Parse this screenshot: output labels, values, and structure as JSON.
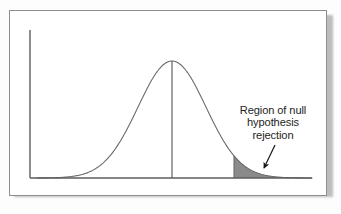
{
  "figure": {
    "name": "normal-distribution-rejection-region",
    "background_color": "#fdfdfd",
    "plate_color": "#ffffff",
    "frame_color": "#8e8e8e"
  },
  "annotation": {
    "name": "rejection-region-label",
    "line1": "Region of null",
    "line2": "hypothesis",
    "line3": "rejection",
    "text_color": "#1d1d1d",
    "pointer": "arrow-icon"
  },
  "chart_data": {
    "type": "area",
    "title": "",
    "subtitle": "",
    "xlabel": "",
    "ylabel": "",
    "grid": false,
    "legend": null,
    "axes": {
      "y_axis_visible": true,
      "x_axis_visible": true,
      "y_axis_x_px": 30,
      "baseline_y_px": 178,
      "y_axis_top_px": 30,
      "x_axis_right_px": 312,
      "tick_labels_x": [],
      "tick_labels_y": []
    },
    "curve": {
      "name": "normal-density-curve",
      "distribution": "normal",
      "mean_x_px": 172,
      "peak_y_px": 61,
      "sigma_px": 34,
      "stroke_color": "#6a6a6a",
      "stroke_width": 1.1,
      "x_start_px": 37,
      "x_end_px": 312
    },
    "center_line": {
      "name": "mean-vertical-line",
      "x_px": 172,
      "y_top_px": 61,
      "y_bottom_px": 178,
      "stroke_color": "#545454"
    },
    "shaded_region": {
      "name": "rejection-region-shading",
      "label": "Region of null hypothesis rejection",
      "tail": "right",
      "x_start_px": 234,
      "x_end_px": 312,
      "fill_color": "#8a8a8a",
      "boundary_line_color": "#6a6a6a",
      "approx_sigma_from_mean": 1.82
    },
    "arrow": {
      "name": "annotation-arrow",
      "x1_px": 275,
      "y1_px": 145,
      "x2_px": 264,
      "y2_px": 168,
      "color": "#161616"
    }
  }
}
